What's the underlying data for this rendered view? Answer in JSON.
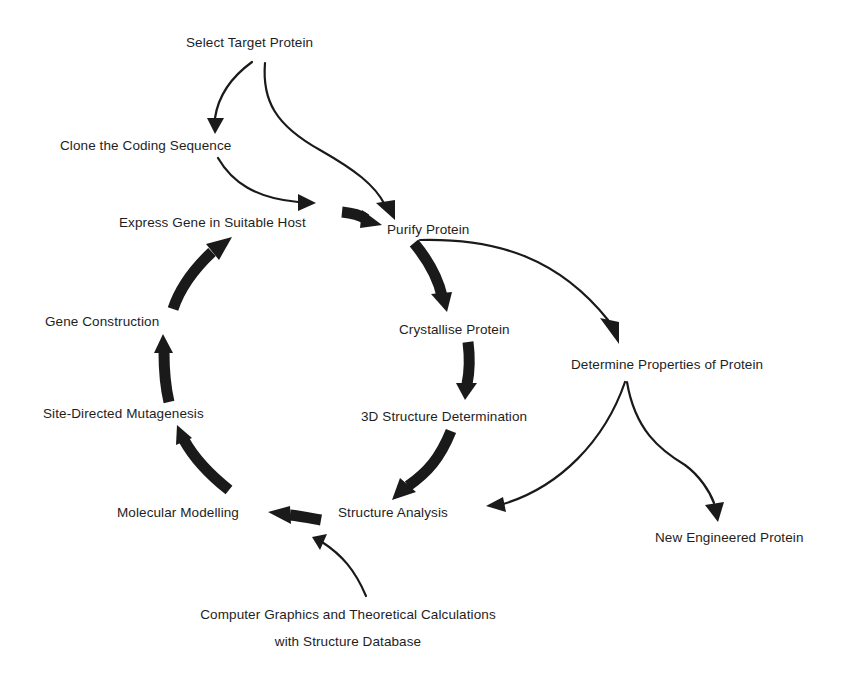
{
  "diagram": {
    "type": "flowchart-cycle",
    "nodes": {
      "select_target": "Select Target Protein",
      "clone_coding": "Clone the Coding Sequence",
      "express_gene": "Express Gene in Suitable Host",
      "purify": "Purify Protein",
      "crystallise": "Crystallise Protein",
      "determine_props": "Determine Properties of Protein",
      "structure_det": "3D Structure Determination",
      "structure_analysis": "Structure Analysis",
      "new_protein": "New Engineered Protein",
      "molecular_modelling": "Molecular Modelling",
      "site_directed": "Site-Directed Mutagenesis",
      "gene_construction": "Gene Construction",
      "computer_graphics_line1": "Computer Graphics and Theoretical Calculations",
      "computer_graphics_line2": "with Structure Database"
    },
    "edges": [
      {
        "from": "Select Target Protein",
        "to": "Clone the Coding Sequence",
        "style": "thin"
      },
      {
        "from": "Select Target Protein",
        "to": "Purify Protein",
        "style": "thin"
      },
      {
        "from": "Clone the Coding Sequence",
        "to": "Express Gene in Suitable Host",
        "style": "thin"
      },
      {
        "from": "Express Gene in Suitable Host",
        "to": "Purify Protein",
        "style": "thick"
      },
      {
        "from": "Purify Protein",
        "to": "Crystallise Protein",
        "style": "thick"
      },
      {
        "from": "Purify Protein",
        "to": "Determine Properties of Protein",
        "style": "thin"
      },
      {
        "from": "Crystallise Protein",
        "to": "3D Structure Determination",
        "style": "thick"
      },
      {
        "from": "3D Structure Determination",
        "to": "Structure Analysis",
        "style": "thick"
      },
      {
        "from": "Determine Properties of Protein",
        "to": "Structure Analysis",
        "style": "thin"
      },
      {
        "from": "Determine Properties of Protein",
        "to": "New Engineered Protein",
        "style": "thin"
      },
      {
        "from": "Structure Analysis",
        "to": "Molecular Modelling",
        "style": "thick"
      },
      {
        "from": "Computer Graphics and Theoretical Calculations with Structure Database",
        "to": "Molecular Modelling",
        "style": "thin"
      },
      {
        "from": "Molecular Modelling",
        "to": "Site-Directed Mutagenesis",
        "style": "thick"
      },
      {
        "from": "Site-Directed Mutagenesis",
        "to": "Gene Construction",
        "style": "thick"
      },
      {
        "from": "Gene Construction",
        "to": "Express Gene in Suitable Host",
        "style": "thick"
      }
    ]
  },
  "colors": {
    "ink": "#1a1a1a",
    "background": "#ffffff"
  }
}
